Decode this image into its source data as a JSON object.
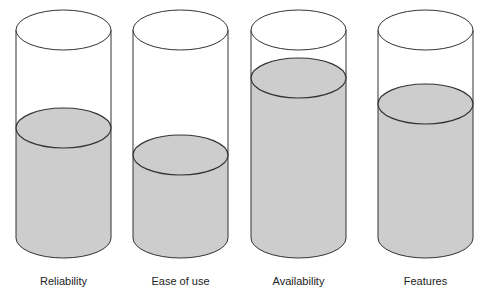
{
  "style": {
    "fill_color": "#cdcdcd",
    "stroke_color": "#333333",
    "background": "#ffffff"
  },
  "chart_data": {
    "type": "bar",
    "subtype": "cylinder-fill",
    "title": "",
    "categories": [
      "Reliability",
      "Ease of use",
      "Availability",
      "Features"
    ],
    "values": [
      53,
      40,
      77,
      64
    ],
    "unit": "percent filled (estimated)",
    "ylim": [
      0,
      100
    ],
    "grid": false,
    "legend": false
  },
  "cylinders": [
    {
      "label": "Reliability",
      "cx": 63.5,
      "fill_y": 128
    },
    {
      "label": "Ease of use",
      "cx": 180.5,
      "fill_y": 155
    },
    {
      "label": "Availability",
      "cx": 298.5,
      "fill_y": 78
    },
    {
      "label": "Features",
      "cx": 425.5,
      "fill_y": 104
    }
  ]
}
